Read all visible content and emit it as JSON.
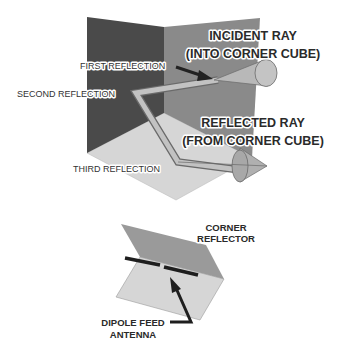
{
  "figure_top": {
    "title": "Corner cube reflector",
    "labels": {
      "incident_line1": "INCIDENT RAY",
      "incident_line2": "(INTO CORNER CUBE)",
      "first": "FIRST REFLECTION",
      "second": "SECOND REFLECTION",
      "reflected_line1": "REFLECTED RAY",
      "reflected_line2": "(FROM CORNER CUBE)",
      "third": "THIRD REFLECTION"
    },
    "colors": {
      "left_wall": "#4a4a4a",
      "right_wall": "#8a8a8a",
      "floor": "#d6d6d6",
      "ray": "#b8b8b8",
      "ray_edge": "#6a6a6a"
    }
  },
  "figure_bottom": {
    "title": "Corner reflector antenna",
    "labels": {
      "reflector_line1": "CORNER",
      "reflector_line2": "REFLECTOR",
      "dipole_line1": "DIPOLE FEED",
      "dipole_line2": "ANTENNA"
    },
    "colors": {
      "top_panel": "#9a9a9a",
      "bottom_panel": "#d6d6d6",
      "dipole": "#1e1e1e"
    }
  }
}
